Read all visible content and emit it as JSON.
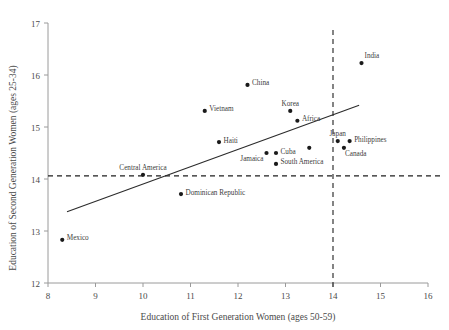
{
  "chart_data": {
    "type": "scatter",
    "title": "",
    "xlabel": "Education of First Generation Women (ages 50-59)",
    "ylabel": "Education of Second Generation Women (ages 25-34)",
    "xlim": [
      8,
      16
    ],
    "ylim": [
      12,
      17
    ],
    "xticks": [
      "8",
      "9",
      "10",
      "11",
      "12",
      "13",
      "14",
      "15",
      "16"
    ],
    "yticks": [
      "12",
      "13",
      "14",
      "15",
      "16",
      "17"
    ],
    "grid": false,
    "legend": "none",
    "points": [
      {
        "label": "Mexico",
        "x": 8.3,
        "y": 12.83,
        "label_pos": "right"
      },
      {
        "label": "Central America",
        "x": 10.0,
        "y": 14.08,
        "label_pos": "above"
      },
      {
        "label": "Dominican Republic",
        "x": 10.8,
        "y": 13.71,
        "label_pos": "right"
      },
      {
        "label": "Vietnam",
        "x": 11.3,
        "y": 15.31,
        "label_pos": "right"
      },
      {
        "label": "Haiti",
        "x": 11.6,
        "y": 14.71,
        "label_pos": "right"
      },
      {
        "label": "China",
        "x": 12.2,
        "y": 15.81,
        "label_pos": "right"
      },
      {
        "label": "Jamaica",
        "x": 12.6,
        "y": 14.5,
        "label_pos": "below-left"
      },
      {
        "label": "Cuba",
        "x": 12.8,
        "y": 14.5,
        "label_pos": "right"
      },
      {
        "label": "South America",
        "x": 12.8,
        "y": 14.29,
        "label_pos": "right"
      },
      {
        "label": "Korea",
        "x": 13.1,
        "y": 15.31,
        "label_pos": "above"
      },
      {
        "label": "Africa",
        "x": 13.25,
        "y": 15.12,
        "label_pos": "right"
      },
      {
        "label": "",
        "x": 13.5,
        "y": 14.6,
        "label_pos": "none"
      },
      {
        "label": "Japan",
        "x": 14.1,
        "y": 14.73,
        "label_pos": "above"
      },
      {
        "label": "Philippines",
        "x": 14.35,
        "y": 14.73,
        "label_pos": "right"
      },
      {
        "label": "Canada",
        "x": 14.23,
        "y": 14.6,
        "label_pos": "below-right"
      },
      {
        "label": "India",
        "x": 14.6,
        "y": 16.23,
        "label_pos": "above-right"
      }
    ],
    "trend_line": {
      "x0": 8.4,
      "y0": 13.37,
      "x1": 14.55,
      "y1": 15.42
    },
    "reference_lines": [
      {
        "orientation": "horizontal",
        "value": 14.06,
        "style": "dashed"
      },
      {
        "orientation": "vertical",
        "value": 14.0,
        "style": "dashed"
      }
    ],
    "colors": {
      "marker": "#1a1a1a",
      "trend": "#2b2b2b",
      "reference": "#1f1f1f",
      "axis": "#9a9a9a",
      "text": "#4a4a4a",
      "background": "#ffffff"
    }
  }
}
